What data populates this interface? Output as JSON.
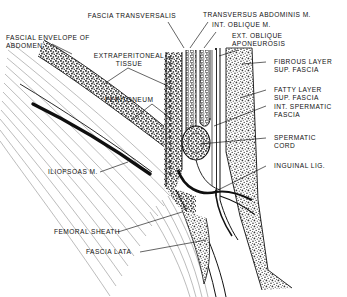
{
  "figure": {
    "kind": "anatomical-line-diagram",
    "title_visible": false,
    "region": "inguinal region sagittal section",
    "background_color": "#ffffff",
    "ink_color": "#111111",
    "stipple_color": "#4a4a4a",
    "width": 347,
    "height": 297
  },
  "labels": {
    "fascia_transversalis": "FASCIA TRANSVERSALIS",
    "transversus_abdominis": "TRANSVERSUS ABDOMINIS M.",
    "int_oblique": "INT. OBLIQUE M.",
    "ext_oblique_aponeurosis_l1": "EXT. OBLIQUE",
    "ext_oblique_aponeurosis_l2": "APONEUROSIS",
    "fascial_envelope_l1": "FASCIAL ENVELOPE OF",
    "fascial_envelope_l2": "ABDOMEN",
    "extraperitoneal_l1": "EXTRAPERITONEAL",
    "extraperitoneal_l2": "TISSUE",
    "fibrous_layer_l1": "FIBROUS LAYER",
    "fibrous_layer_l2": "SUP. FASCIA",
    "fatty_layer_l1": "FATTY LAYER",
    "fatty_layer_l2": "SUP. FASCIA",
    "int_spermatic_l1": "INT. SPERMATIC",
    "int_spermatic_l2": "FASCIA",
    "peritoneum": "PERITONEUM",
    "spermatic_cord_l1": "SPERMATIC",
    "spermatic_cord_l2": "CORD",
    "inguinal_lig": "INGUINAL LIG.",
    "iliopsoas": "ILIOPSOAS M.",
    "femoral_sheath": "FEMORAL SHEATH",
    "fascia_lata": "FASCIA LATA"
  }
}
